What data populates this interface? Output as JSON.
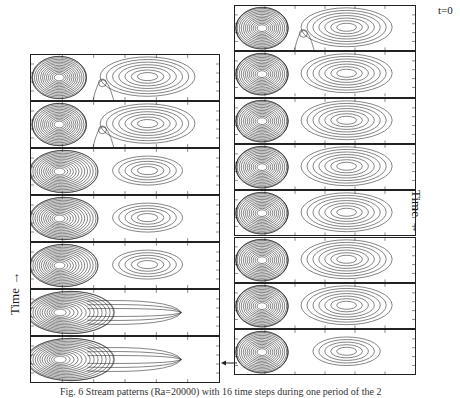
{
  "figure": {
    "caption": "Fig. 6 Stream patterns (Ra=20000) with 16 time steps during one period of the 2",
    "labels": {
      "t0": "t=0",
      "time_right": "Time →",
      "time_left": "Time →"
    },
    "left_column": {
      "panel_count": 7,
      "order": "bottom-to-top (time increases upward)",
      "panels": [
        {
          "index": 1,
          "right_vortex": "distinct",
          "gap_eddy": true
        },
        {
          "index": 2,
          "right_vortex": "distinct",
          "gap_eddy": true
        },
        {
          "index": 3,
          "right_vortex": "merging",
          "gap_eddy": false
        },
        {
          "index": 4,
          "right_vortex": "elongated",
          "gap_eddy": false
        },
        {
          "index": 5,
          "right_vortex": "elongated",
          "gap_eddy": false
        },
        {
          "index": 6,
          "right_vortex": "absent",
          "gap_eddy": false
        },
        {
          "index": 7,
          "right_vortex": "absent",
          "gap_eddy": false
        }
      ]
    },
    "right_column": {
      "panel_count": 8,
      "order": "top-to-bottom (time increases downward, starts at t=0)",
      "panels": [
        {
          "index": 1,
          "right_vortex": "distinct",
          "gap_eddy": true
        },
        {
          "index": 2,
          "right_vortex": "distinct",
          "gap_eddy": false
        },
        {
          "index": 3,
          "right_vortex": "distinct",
          "gap_eddy": false
        },
        {
          "index": 4,
          "right_vortex": "distinct",
          "gap_eddy": false
        },
        {
          "index": 5,
          "right_vortex": "distinct",
          "gap_eddy": false
        },
        {
          "index": 6,
          "right_vortex": "distinct",
          "gap_eddy": false
        },
        {
          "index": 7,
          "right_vortex": "distinct",
          "gap_eddy": false
        },
        {
          "index": 8,
          "right_vortex": "shrinking",
          "gap_eddy": false
        }
      ]
    },
    "connector": "arrow from bottom of right column to bottom of left column"
  }
}
